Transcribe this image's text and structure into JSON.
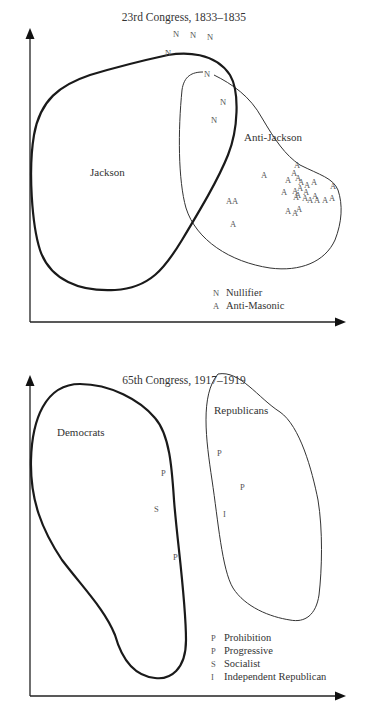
{
  "panels": [
    {
      "title": "23rd Congress, 1833–1835",
      "regions": [
        {
          "name": "Jackson",
          "label": "Jackson",
          "style": "thick"
        },
        {
          "name": "Anti-Jackson",
          "label": "Anti-Jackson",
          "style": "thin"
        }
      ],
      "marks": [
        {
          "symbol": "N",
          "party": "Nullifier"
        },
        {
          "symbol": "N",
          "party": "Nullifier"
        },
        {
          "symbol": "N",
          "party": "Nullifier"
        },
        {
          "symbol": "N",
          "party": "Nullifier"
        },
        {
          "symbol": "N",
          "party": "Nullifier"
        },
        {
          "symbol": "N",
          "party": "Nullifier"
        },
        {
          "symbol": "N",
          "party": "Nullifier"
        },
        {
          "symbol": "A",
          "party": "Anti-Masonic"
        }
      ],
      "anti_masonic_count": 27,
      "legend": [
        {
          "key": "N",
          "label": "Nullifier"
        },
        {
          "key": "A",
          "label": "Anti-Masonic"
        }
      ]
    },
    {
      "title": "65th Congress, 1917–1919",
      "regions": [
        {
          "name": "Democrats",
          "label": "Democrats",
          "style": "thick"
        },
        {
          "name": "Republicans",
          "label": "Republicans",
          "style": "thin"
        }
      ],
      "marks": [
        {
          "symbol": "P",
          "party": "Progressive"
        },
        {
          "symbol": "S",
          "party": "Socialist"
        },
        {
          "symbol": "P",
          "party": "Prohibition"
        },
        {
          "symbol": "P",
          "party": "Progressive"
        },
        {
          "symbol": "P",
          "party": "Progressive"
        },
        {
          "symbol": "I",
          "party": "Independent Republican"
        }
      ],
      "legend": [
        {
          "key": "P",
          "label": "Prohibition"
        },
        {
          "key": "P",
          "label": "Progressive"
        },
        {
          "key": "S",
          "label": "Socialist"
        },
        {
          "key": "I",
          "label": "Independent Republican"
        }
      ]
    }
  ]
}
